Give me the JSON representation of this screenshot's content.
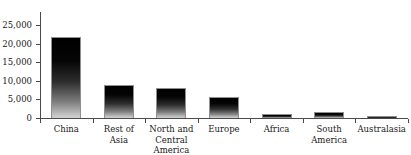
{
  "chart_data": {
    "type": "bar",
    "title": "",
    "xlabel": "",
    "ylabel": "",
    "ylim": [
      0,
      25000
    ],
    "yticks": [
      0,
      5000,
      10000,
      15000,
      20000,
      25000
    ],
    "ytick_labels": [
      "0",
      "5,000",
      "10,000",
      "15,000",
      "20,000",
      "25,000"
    ],
    "grid": false,
    "legend": false,
    "categories": [
      "China",
      "Rest of Asia",
      "North and Central America",
      "Europe",
      "Africa",
      "South America",
      "Australasia"
    ],
    "category_lines": [
      [
        "China"
      ],
      [
        "Rest of",
        "Asia"
      ],
      [
        "North and",
        "Central",
        "America"
      ],
      [
        "Europe"
      ],
      [
        "Africa"
      ],
      [
        "South",
        "America"
      ],
      [
        "Australasia"
      ]
    ],
    "values": [
      21800,
      8900,
      8100,
      5550,
      1100,
      1700,
      450
    ],
    "bar_style": {
      "fill": "vertical-gradient-black-to-grey",
      "top_color": "#000000",
      "bottom_color": "#d2d2d2",
      "border_color": "#8f8f8f"
    },
    "axis_color": "#4a4a4a",
    "text_color": "#1a1a1a",
    "background": "#ffffff"
  },
  "title_strip": {
    "text": ""
  }
}
